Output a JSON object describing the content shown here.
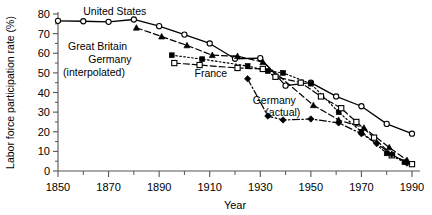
{
  "chart_data": {
    "type": "line",
    "title": "",
    "xlabel": "Year",
    "ylabel": "Labor force participation rate (%)",
    "xlim": [
      1845,
      1995
    ],
    "ylim": [
      0,
      82
    ],
    "xticks": [
      1850,
      1870,
      1890,
      1910,
      1930,
      1950,
      1970,
      1990
    ],
    "xtick_labels": [
      "1850",
      "1870",
      "1890",
      "1910",
      "1930",
      "1950",
      "1970",
      "1990"
    ],
    "xminor_ticks": [
      1860,
      1880,
      1900,
      1920,
      1940,
      1960,
      1980
    ],
    "yticks": [
      0,
      10,
      20,
      30,
      40,
      50,
      60,
      70,
      80
    ],
    "ytick_labels": [
      "0",
      "10",
      "20",
      "30",
      "40",
      "50",
      "60",
      "70",
      "80"
    ],
    "grid": false,
    "legend": "inline-annotations",
    "series": [
      {
        "name": "United States",
        "style": "solid",
        "marker": "open-circle",
        "points": [
          {
            "x": 1850,
            "y": 76.5
          },
          {
            "x": 1860,
            "y": 76.3
          },
          {
            "x": 1870,
            "y": 76.0
          },
          {
            "x": 1880,
            "y": 77.2
          },
          {
            "x": 1890,
            "y": 73.8
          },
          {
            "x": 1900,
            "y": 69.5
          },
          {
            "x": 1910,
            "y": 65.0
          },
          {
            "x": 1920,
            "y": 57.2
          },
          {
            "x": 1930,
            "y": 57.5
          },
          {
            "x": 1940,
            "y": 43.5
          },
          {
            "x": 1950,
            "y": 45.0
          },
          {
            "x": 1960,
            "y": 38.0
          },
          {
            "x": 1970,
            "y": 33.0
          },
          {
            "x": 1980,
            "y": 24.0
          },
          {
            "x": 1990,
            "y": 19.0
          }
        ]
      },
      {
        "name": "Great Britain",
        "style": "dashed",
        "marker": "filled-triangle",
        "points": [
          {
            "x": 1881,
            "y": 73.0
          },
          {
            "x": 1891,
            "y": 68.5
          },
          {
            "x": 1901,
            "y": 64.0
          },
          {
            "x": 1911,
            "y": 59.0
          },
          {
            "x": 1921,
            "y": 58.5
          },
          {
            "x": 1931,
            "y": 55.5
          },
          {
            "x": 1951,
            "y": 33.5
          },
          {
            "x": 1961,
            "y": 26.0
          },
          {
            "x": 1971,
            "y": 22.0
          },
          {
            "x": 1981,
            "y": 12.0
          },
          {
            "x": 1988,
            "y": 5.5
          }
        ]
      },
      {
        "name": "Germany (interpolated)",
        "style": "dotted",
        "marker": "filled-square",
        "points": [
          {
            "x": 1895,
            "y": 59.0
          },
          {
            "x": 1907,
            "y": 57.0
          },
          {
            "x": 1925,
            "y": 53.5
          },
          {
            "x": 1933,
            "y": 51.0
          },
          {
            "x": 1939,
            "y": 50.0
          },
          {
            "x": 1950,
            "y": 44.5
          },
          {
            "x": 1961,
            "y": 30.0
          },
          {
            "x": 1970,
            "y": 20.0
          },
          {
            "x": 1980,
            "y": 9.0
          },
          {
            "x": 1987,
            "y": 4.5
          }
        ]
      },
      {
        "name": "France",
        "style": "dashed",
        "marker": "open-square",
        "points": [
          {
            "x": 1896,
            "y": 55.0
          },
          {
            "x": 1906,
            "y": 54.0
          },
          {
            "x": 1921,
            "y": 52.5
          },
          {
            "x": 1931,
            "y": 52.0
          },
          {
            "x": 1936,
            "y": 48.0
          },
          {
            "x": 1946,
            "y": 45.0
          },
          {
            "x": 1954,
            "y": 38.0
          },
          {
            "x": 1962,
            "y": 32.0
          },
          {
            "x": 1968,
            "y": 25.0
          },
          {
            "x": 1975,
            "y": 17.0
          },
          {
            "x": 1982,
            "y": 8.0
          },
          {
            "x": 1990,
            "y": 3.5
          }
        ]
      },
      {
        "name": "Germany (actual)",
        "style": "dash-dot",
        "marker": "filled-diamond",
        "points": [
          {
            "x": 1925,
            "y": 47.0
          },
          {
            "x": 1933,
            "y": 28.0
          },
          {
            "x": 1939,
            "y": 26.0
          },
          {
            "x": 1950,
            "y": 26.5
          },
          {
            "x": 1961,
            "y": 24.5
          },
          {
            "x": 1970,
            "y": 19.0
          },
          {
            "x": 1976,
            "y": 14.0
          },
          {
            "x": 1982,
            "y": 8.5
          },
          {
            "x": 1988,
            "y": 4.0
          }
        ]
      }
    ],
    "annotations": [
      {
        "text": "United States",
        "x": 1860,
        "y": 79.5,
        "align": "start"
      },
      {
        "text": "Great Britain",
        "x": 1854,
        "y": 61.5,
        "align": "start"
      },
      {
        "text": "Germany",
        "x": 1862,
        "y": 55.0,
        "align": "start"
      },
      {
        "text": "(interpolated)",
        "x": 1852,
        "y": 48.5,
        "align": "start"
      },
      {
        "text": "France",
        "x": 1904,
        "y": 48.0,
        "align": "start"
      },
      {
        "text": "Germany",
        "x": 1927,
        "y": 34.0,
        "align": "start"
      },
      {
        "text": "(actual)",
        "x": 1932,
        "y": 28.0,
        "align": "start"
      }
    ]
  }
}
